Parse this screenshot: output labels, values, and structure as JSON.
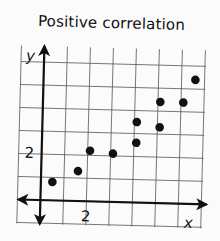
{
  "chart_data": {
    "type": "scatter",
    "title": "Positive correlation",
    "xlabel": "x",
    "ylabel": "y",
    "x_tick_labels": [
      "2"
    ],
    "y_tick_labels": [
      "2"
    ],
    "grid": true,
    "xlim": [
      -1,
      7
    ],
    "ylim": [
      -1,
      6
    ],
    "points": [
      {
        "x": 0.5,
        "y": 0.8
      },
      {
        "x": 1.6,
        "y": 1.3
      },
      {
        "x": 2.1,
        "y": 2.2
      },
      {
        "x": 3.1,
        "y": 2.1
      },
      {
        "x": 4.1,
        "y": 2.6
      },
      {
        "x": 4.1,
        "y": 3.5
      },
      {
        "x": 5.1,
        "y": 3.3
      },
      {
        "x": 5.1,
        "y": 4.4
      },
      {
        "x": 6.1,
        "y": 4.4
      },
      {
        "x": 6.6,
        "y": 5.4
      }
    ],
    "legend": null
  },
  "labels": {
    "title": "Positive correlation",
    "x_axis": "x",
    "y_axis": "y",
    "x_tick": "2",
    "y_tick": "2"
  }
}
